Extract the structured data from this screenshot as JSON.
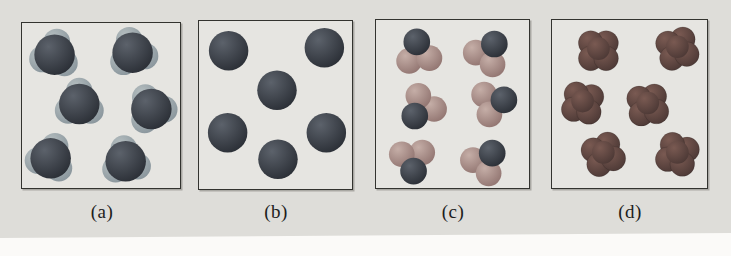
{
  "figure": {
    "colors": {
      "page_background": "#fbfaf7",
      "figure_background": "#deddd9",
      "panel_background": "#e6e5e1",
      "panel_border": "#33332f",
      "label_text": "#1c1c1c",
      "atom_dark": "#282c33",
      "atom_dark_highlight": "#5c626b",
      "lobe_light": "#87939a",
      "lobe_light_highlight": "#b5bec0",
      "atom_salmon": "#8f726e",
      "atom_salmon_highlight": "#c5aea7",
      "atom_maroon": "#4a3734",
      "atom_maroon_highlight": "#7a5a52"
    },
    "panels": [
      {
        "id": "a",
        "label": "(a)",
        "type": "pyramidal",
        "view": {
          "w": 160,
          "h": 167
        },
        "molecules": [
          {
            "x": 33,
            "y": 32,
            "rot": -10
          },
          {
            "x": 112,
            "y": 30,
            "rot": 15
          },
          {
            "x": 58,
            "y": 82,
            "rot": 0
          },
          {
            "x": 131,
            "y": 87,
            "rot": 28
          },
          {
            "x": 29,
            "y": 137,
            "rot": -20
          },
          {
            "x": 105,
            "y": 140,
            "rot": 8
          }
        ]
      },
      {
        "id": "b",
        "label": "(b)",
        "type": "atom",
        "view": {
          "w": 155,
          "h": 170
        },
        "molecules": [
          {
            "x": 30,
            "y": 30,
            "rot": 0
          },
          {
            "x": 127,
            "y": 27,
            "rot": 0
          },
          {
            "x": 79,
            "y": 70,
            "rot": 0
          },
          {
            "x": 29,
            "y": 113,
            "rot": 0
          },
          {
            "x": 129,
            "y": 113,
            "rot": 0
          },
          {
            "x": 80,
            "y": 140,
            "rot": 0
          }
        ]
      },
      {
        "id": "c",
        "label": "(c)",
        "type": "bent",
        "view": {
          "w": 155,
          "h": 170
        },
        "molecules": [
          {
            "x": 43,
            "y": 34,
            "rot": 8
          },
          {
            "x": 113,
            "y": 34,
            "rot": -35
          },
          {
            "x": 47,
            "y": 88,
            "rot": 140
          },
          {
            "x": 118,
            "y": 84,
            "rot": -75
          },
          {
            "x": 37,
            "y": 141,
            "rot": 185
          },
          {
            "x": 110,
            "y": 144,
            "rot": -40
          }
        ]
      },
      {
        "id": "d",
        "label": "(d)",
        "type": "cluster",
        "view": {
          "w": 157,
          "h": 170
        },
        "molecules": [
          {
            "x": 47,
            "y": 31,
            "rot": 0
          },
          {
            "x": 127,
            "y": 29,
            "rot": 15
          },
          {
            "x": 31,
            "y": 84,
            "rot": -10
          },
          {
            "x": 97,
            "y": 86,
            "rot": 8
          },
          {
            "x": 52,
            "y": 136,
            "rot": 22
          },
          {
            "x": 127,
            "y": 136,
            "rot": -18
          }
        ]
      }
    ]
  }
}
